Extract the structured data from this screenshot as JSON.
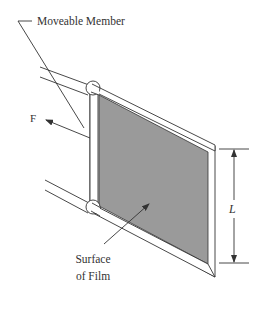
{
  "diagram": {
    "labels": {
      "moveable_member": "Moveable Member",
      "force": "F",
      "length": "L",
      "surface_line1": "Surface",
      "surface_line2": "of Film"
    },
    "colors": {
      "line": "#333333",
      "film_fill": "#9a9a9a",
      "frame_fill": "#ffffff",
      "background": "#ffffff"
    }
  }
}
